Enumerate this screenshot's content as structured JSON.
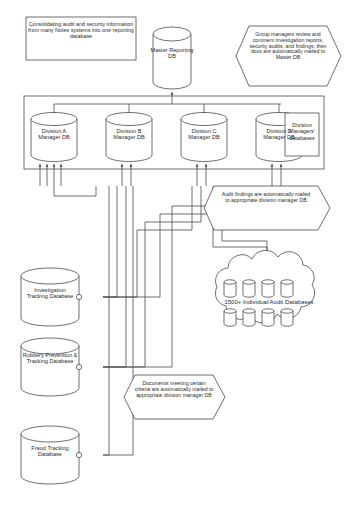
{
  "diagram": {
    "colors": {
      "stroke": "#4a4a4a",
      "text": "#2b2b2b",
      "background": "#ffffff",
      "fill": "#ffffff"
    }
  },
  "notes": {
    "consolidating": "Consolidating audit and security information from many Notes systems into one reporting database"
  },
  "hexagons": [
    {
      "id": "group-managers",
      "text": "Group managers review and comment investigation reports, security audits, and findings, then docs are automatically mailed to Master DB"
    },
    {
      "id": "audit-findings",
      "text": "Audit findings are automatically mailed to appropriate division manager DB"
    },
    {
      "id": "documents-meeting-criteria",
      "text": "Documents meeting certain criteria are automatically mailed to appropriate division manager DB"
    }
  ],
  "master": {
    "label": "Master Reporting DB"
  },
  "division_group": {
    "label": "Division Managers' databases",
    "databases": [
      {
        "label": "Division A Manager DB"
      },
      {
        "label": "Division B Manager DB"
      },
      {
        "label": "Division C Manager DB"
      },
      {
        "label": "Division D Manager DB"
      }
    ]
  },
  "cloud": {
    "label": "1500+ Individual Audit Databases",
    "small_db_count": 8
  },
  "source_databases": [
    {
      "label": "Investigation Tracking Database"
    },
    {
      "label": "Robbery Prevention & Tracking Database"
    },
    {
      "label": "Fraud Tracking Database"
    }
  ]
}
